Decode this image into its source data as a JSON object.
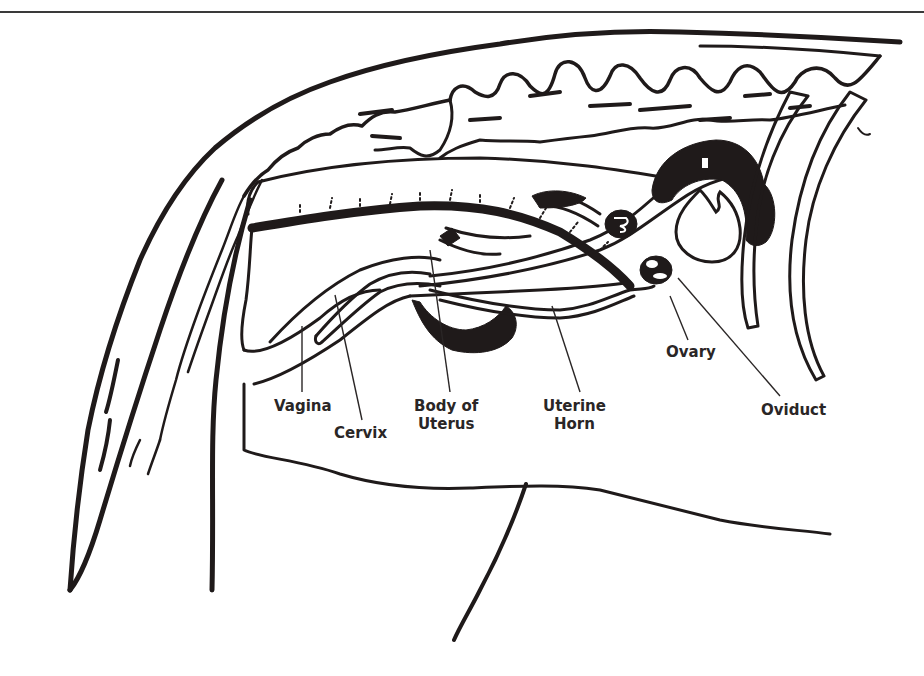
{
  "diagram": {
    "colors": {
      "ink": "#1f1a1a",
      "label_text": "#2a2626",
      "background": "#ffffff",
      "top_rule": "#3a3a3a"
    },
    "labels": [
      {
        "id": "vagina",
        "lines": [
          "Vagina"
        ]
      },
      {
        "id": "cervix",
        "lines": [
          "Cervix"
        ]
      },
      {
        "id": "body-of-uterus",
        "lines": [
          "Body of",
          "Uterus"
        ]
      },
      {
        "id": "uterine-horn",
        "lines": [
          "Uterine",
          "Horn"
        ]
      },
      {
        "id": "ovary",
        "lines": [
          "Ovary"
        ]
      },
      {
        "id": "oviduct",
        "lines": [
          "Oviduct"
        ]
      }
    ],
    "structures_drawn": [
      "spine-vertebrae",
      "rectum",
      "vagina",
      "cervix",
      "body-of-uterus",
      "uterine-horns",
      "ovaries",
      "oviduct",
      "bladder",
      "ribs",
      "tail",
      "hind-leg",
      "belly-outline"
    ]
  }
}
